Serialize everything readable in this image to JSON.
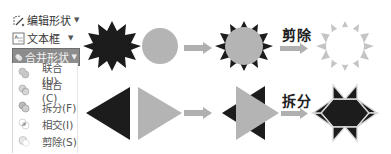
{
  "ribbon_menu": {
    "edit_shape": {
      "label": "编辑形状",
      "icon": "edit-shape-icon"
    },
    "text_box": {
      "label": "文本框",
      "icon": "text-box-icon"
    },
    "merge_shapes": {
      "label": "合并形状",
      "icon": "merge-shapes-icon",
      "state": "active"
    },
    "submenu": [
      {
        "label": "联合(U)",
        "icon": "union-icon"
      },
      {
        "label": "组合(C)",
        "icon": "combine-icon"
      },
      {
        "label": "拆分(F)",
        "icon": "fragment-icon"
      },
      {
        "label": "相交(I)",
        "icon": "intersect-icon"
      },
      {
        "label": "剪除(S)",
        "icon": "subtract-icon"
      }
    ]
  },
  "diagram": {
    "row1": {
      "operation_label": "剪除",
      "shapes": [
        "black-spiky-star",
        "gray-circle",
        "star-with-circle-overlay",
        "hollow-star-outline"
      ]
    },
    "row2": {
      "operation_label": "拆分",
      "shapes": [
        "black-left-triangle",
        "gray-right-triangle",
        "overlapping-triangles",
        "fragmented-hexagram"
      ]
    },
    "colors": {
      "black": "#1c1c1c",
      "gray": "#b4b4b4",
      "arrow": "#b0b0b0",
      "menu_active_bg": "#8c8c8c"
    }
  }
}
